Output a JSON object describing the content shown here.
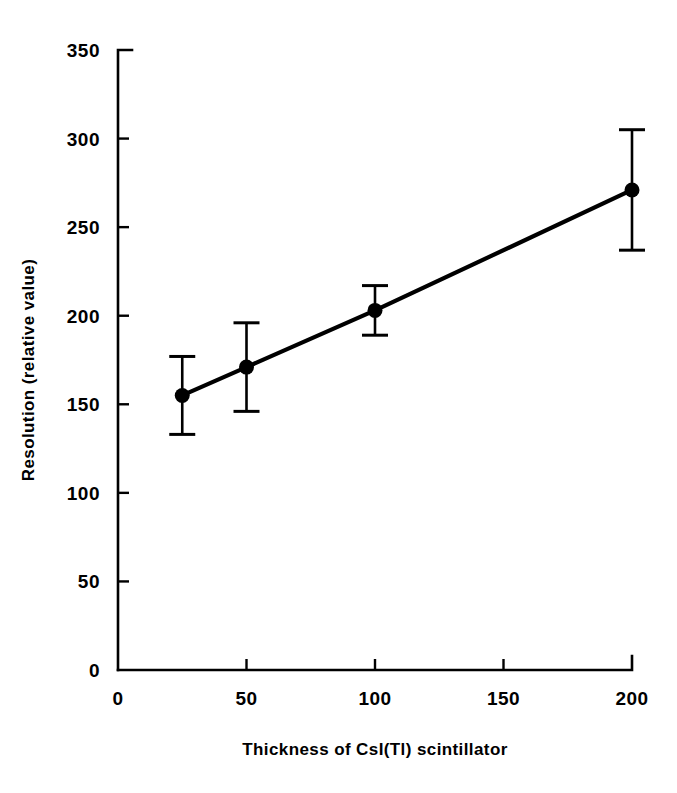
{
  "chart_data": {
    "type": "line",
    "title": "",
    "subtitle": "",
    "xlabel": "Thickness of CsI(Tl) scintillator",
    "ylabel": "Resolution (relative value)",
    "xlim": [
      0,
      200
    ],
    "ylim": [
      0,
      350
    ],
    "xticks": [
      0,
      50,
      100,
      150,
      200
    ],
    "xtick_labels": [
      "0",
      "50",
      "100",
      "150",
      "200"
    ],
    "yticks": [
      0,
      50,
      100,
      150,
      200,
      250,
      300,
      350
    ],
    "ytick_labels": [
      "0",
      "50",
      "100",
      "150",
      "200",
      "250",
      "300",
      "350"
    ],
    "grid": false,
    "legend": false,
    "legend_position": "none",
    "marker": "filled-circle",
    "line_color": "#000000",
    "marker_color": "#000000",
    "error_bar_color": "#000000",
    "x": [
      25,
      50,
      100,
      200
    ],
    "series": [
      {
        "name": "Resolution",
        "values": [
          155,
          171,
          203,
          271
        ],
        "yerr": [
          22,
          25,
          14,
          34
        ],
        "y_lower": [
          133,
          146,
          189,
          237
        ],
        "y_upper": [
          177,
          196,
          217,
          305
        ]
      }
    ],
    "annotations": []
  }
}
